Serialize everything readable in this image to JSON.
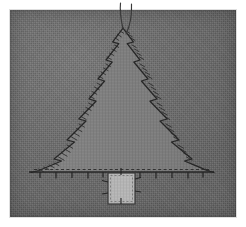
{
  "image": {
    "subject": "embroidered christmas tree applique on gray fabric",
    "width": 246,
    "height": 227,
    "border_color": "#ffffff",
    "border_width_px": 10
  },
  "fabric": {
    "name": "background-fabric-panel",
    "color": "#6d6d6d",
    "weave": "woven-linen-texture",
    "rect": {
      "x": 10,
      "y": 10,
      "w": 226,
      "h": 207
    }
  },
  "tree": {
    "name": "christmas-tree-applique",
    "fill_color": "#7a7a7a",
    "outline_color": "#2b2b2b",
    "stitch_style": "zigzag-satin",
    "apex": {
      "x": 123,
      "y": 27
    },
    "base_left": {
      "x": 29,
      "y": 172
    },
    "base_right": {
      "x": 214,
      "y": 172
    },
    "tiers_per_side": 8,
    "zigzag_amplitude_px": 5
  },
  "trunk": {
    "name": "tree-trunk-patch",
    "fill_color": "#b4b4b4",
    "outline_color": "#3a3a3a",
    "rect": {
      "x": 108,
      "y": 173,
      "w": 27,
      "h": 31
    },
    "stitch_ticks": 4
  },
  "baseline": {
    "name": "base-stitch-line",
    "color": "#242424",
    "y": 172,
    "x_start": 29,
    "x_end": 214,
    "tick_count": 12,
    "tick_length_px": 7,
    "style": "running-stitch-with-ticks"
  },
  "threads": {
    "name": "hanging-threads",
    "color": "#3a3a3a",
    "count": 2,
    "top_y": 2,
    "attach_y": 30,
    "labels": [
      "thread-left",
      "thread-right"
    ]
  },
  "colors": {
    "fabric_gray": "#6d6d6d",
    "tree_gray": "#7a7a7a",
    "trunk_light": "#b4b4b4",
    "stitch_dark": "#2b2b2b",
    "photo_white": "#ffffff"
  }
}
